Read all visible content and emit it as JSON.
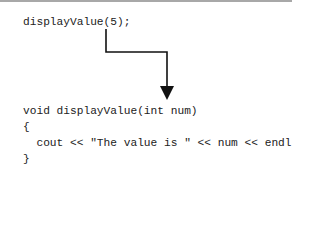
{
  "diagram": {
    "call_statement": "displayValue(5);",
    "function_lines": [
      "void displayValue(int num)",
      "{",
      "  cout << \"The value is \" << num << endl;",
      "}"
    ],
    "arrow": {
      "from": "argument 5 in call",
      "to": "parameter num in function header",
      "color": "#111111"
    }
  }
}
